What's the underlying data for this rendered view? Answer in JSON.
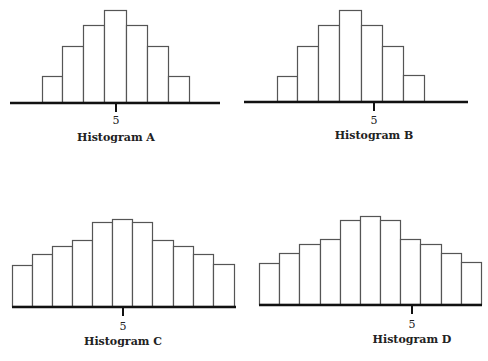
{
  "chart_data": [
    {
      "type": "bar",
      "title": "Histogram A",
      "tick_label": "5",
      "xlabel": "",
      "ylabel": "",
      "grid": false,
      "values": [
        1,
        2,
        3,
        4,
        3,
        2,
        1
      ],
      "layout": {
        "axis_y": 102,
        "axis_x0": 10,
        "axis_x1": 220,
        "bar_edges": [
          42,
          62,
          83,
          104,
          126,
          147,
          168,
          189
        ],
        "bar_tops": [
          76,
          46,
          25,
          10,
          25,
          46,
          76
        ],
        "tick_x": 116,
        "tick_label_y": 114,
        "title_y": 131
      }
    },
    {
      "type": "bar",
      "title": "Histogram B",
      "tick_label": "5",
      "xlabel": "",
      "ylabel": "",
      "grid": false,
      "values": [
        1,
        2,
        3,
        4,
        3,
        2,
        1
      ],
      "layout": {
        "axis_y": 101,
        "axis_x0": 244,
        "axis_x1": 468,
        "bar_edges": [
          277,
          297,
          318,
          339,
          361,
          382,
          403,
          424
        ],
        "bar_tops": [
          76,
          46,
          25,
          10,
          25,
          46,
          75
        ],
        "tick_x": 374,
        "tick_label_y": 114,
        "title_y": 129
      }
    },
    {
      "type": "bar",
      "title": "Histogram C",
      "tick_label": "5",
      "xlabel": "",
      "ylabel": "",
      "grid": false,
      "values": [
        2.0,
        2.6,
        3.0,
        3.3,
        4.2,
        4.4,
        4.2,
        3.3,
        3.0,
        2.6,
        2.0
      ],
      "layout": {
        "axis_y": 306,
        "axis_x0": 12,
        "axis_x1": 236,
        "bar_edges": [
          12,
          32,
          52,
          72,
          92,
          112,
          132,
          152,
          173,
          193,
          213,
          234
        ],
        "bar_tops": [
          265,
          254,
          246,
          240,
          222,
          219,
          222,
          240,
          246,
          254,
          264
        ],
        "tick_x": 123,
        "tick_label_y": 320,
        "title_y": 335
      }
    },
    {
      "type": "bar",
      "title": "Histogram D",
      "tick_label": "5",
      "xlabel": "",
      "ylabel": "",
      "grid": false,
      "values": [
        2.0,
        2.6,
        3.0,
        3.3,
        4.2,
        4.4,
        4.2,
        3.3,
        3.0,
        2.6,
        2.0
      ],
      "layout": {
        "axis_y": 304,
        "axis_x0": 259,
        "axis_x1": 482,
        "bar_edges": [
          259,
          279,
          299,
          320,
          340,
          360,
          380,
          400,
          420,
          441,
          461,
          481
        ],
        "bar_tops": [
          263,
          253,
          244,
          239,
          220,
          216,
          220,
          239,
          244,
          253,
          262
        ],
        "tick_x": 412,
        "tick_label_y": 318,
        "title_y": 333
      }
    }
  ],
  "colors": {
    "background": "#ffffff",
    "bar_fill": "#ffffff",
    "bar_stroke": "#555555",
    "axis": "#111111",
    "text": "#222222"
  }
}
